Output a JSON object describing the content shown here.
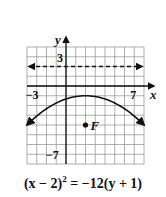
{
  "figure": {
    "type": "parabola-graph",
    "axes": {
      "x_label": "x",
      "y_label": "y",
      "x_range": [
        -4,
        8
      ],
      "y_range": [
        -8,
        4
      ],
      "grid_step": 1
    },
    "tick_labels": {
      "x_neg": "−3",
      "x_pos": "7",
      "y_pos": "3",
      "y_neg": "−7"
    },
    "focus": {
      "label": "F",
      "x": 2,
      "y": -4
    },
    "vertex": {
      "x": 2,
      "y": -1
    },
    "directrix": {
      "y": 2,
      "style": "dashed"
    },
    "equation": {
      "lhs_base": "(x − 2)",
      "lhs_exp": "2",
      "rhs": " = −12(y + 1)"
    },
    "colors": {
      "grid": "#9a9a9a",
      "axes": "#111111",
      "curve": "#111111"
    }
  }
}
